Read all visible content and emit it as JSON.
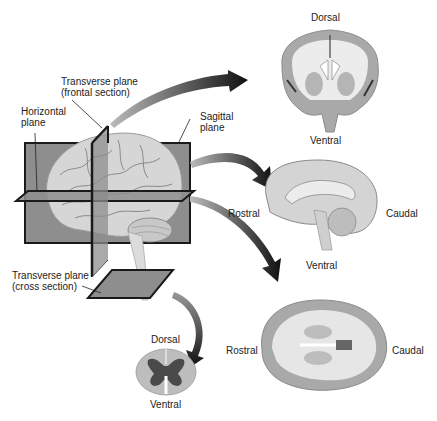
{
  "diagram": {
    "labels": {
      "transverse_frontal": [
        "Transverse plane",
        "(frontal section)"
      ],
      "horizontal": [
        "Horizontal",
        "plane"
      ],
      "sagittal": [
        "Sagittal",
        "plane"
      ],
      "transverse_cross": [
        "Transverse plane",
        "(cross section)"
      ]
    },
    "coronal_section": {
      "top": "Dorsal",
      "bottom": "Ventral"
    },
    "sagittal_section": {
      "left": "Rostral",
      "right": "Caudal",
      "bottom": "Ventral"
    },
    "horizontal_section": {
      "left": "Rostral",
      "right": "Caudal"
    },
    "spinal_cord_section": {
      "top": "Dorsal",
      "bottom": "Ventral"
    },
    "colors": {
      "plane_fill": "#8c8c8c",
      "plane_edge": "#1a1a1a",
      "brain_fill": "#d8d8d8",
      "gray_matter": "#a9a9a9",
      "white_matter": "#ececec",
      "arrow": "#222222"
    }
  }
}
